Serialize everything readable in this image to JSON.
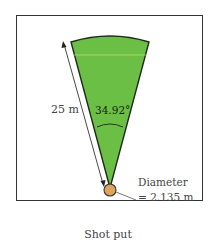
{
  "diagram": {
    "caption": "Shot put",
    "radius_label": "25 m",
    "angle_label": "34.92°",
    "diameter_label_line1": "Diameter",
    "diameter_label_line2": "= 2.135 m",
    "colors": {
      "sector_fill": "#6cbf45",
      "sector_stroke": "#1f2a1a",
      "circle_fill": "#e0a45c",
      "inner_line": "#d8d86a",
      "frame": "#333333"
    }
  }
}
